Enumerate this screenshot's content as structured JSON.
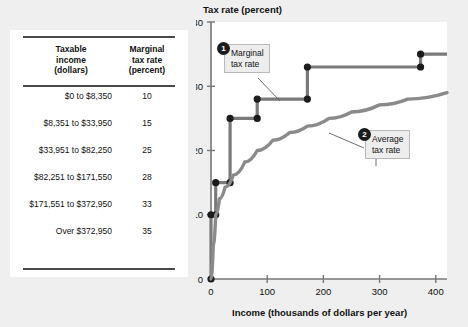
{
  "table": {
    "headers": {
      "income": "Taxable\nincome\n(dollars)",
      "income_l1": "Taxable",
      "income_l2": "income",
      "income_l3": "(dollars)",
      "rate_l1": "Marginal",
      "rate_l2": "tax rate",
      "rate_l3": "(percent)"
    },
    "rows": [
      {
        "income": "$0 to $8,350",
        "rate": "10"
      },
      {
        "income": "$8,351 to $33,950",
        "rate": "15"
      },
      {
        "income": "$33,951 to $82,250",
        "rate": "25"
      },
      {
        "income": "$82,251 to $171,550",
        "rate": "28"
      },
      {
        "income": "$171,551 to $372,950",
        "rate": "33"
      },
      {
        "income": "Over $372,950",
        "rate": "35"
      }
    ]
  },
  "callouts": [
    {
      "number": "1",
      "l1": "Marginal",
      "l2": "tax rate"
    },
    {
      "number": "2",
      "l1": "Average",
      "l2": "tax rate"
    }
  ],
  "chart_data": {
    "type": "line",
    "title": "",
    "ylabel": "Tax rate (percent)",
    "xlabel": "Income (thousands of dollars per year)",
    "xlim": [
      0,
      420
    ],
    "ylim": [
      0,
      40
    ],
    "xticks": [
      0,
      100,
      200,
      300,
      400
    ],
    "xtick_labels": [
      "0",
      "100",
      "200",
      "300",
      "400"
    ],
    "yticks": [
      0,
      10,
      20,
      30,
      40
    ],
    "ytick_labels": [
      "0",
      "10",
      "20",
      "30",
      "40"
    ],
    "grid": false,
    "legend": "none",
    "series": [
      {
        "name": "Marginal tax rate",
        "type": "step",
        "color": "#7a7a7a",
        "marker": "circle",
        "marker_color": "#1c1c1c",
        "points": [
          {
            "x": 0,
            "y": 0
          },
          {
            "x": 0,
            "y": 10
          },
          {
            "x": 8.35,
            "y": 10
          },
          {
            "x": 8.35,
            "y": 15
          },
          {
            "x": 33.95,
            "y": 15
          },
          {
            "x": 33.95,
            "y": 25
          },
          {
            "x": 82.25,
            "y": 25
          },
          {
            "x": 82.25,
            "y": 28
          },
          {
            "x": 171.55,
            "y": 28
          },
          {
            "x": 171.55,
            "y": 33
          },
          {
            "x": 372.95,
            "y": 33
          },
          {
            "x": 372.95,
            "y": 35
          },
          {
            "x": 420,
            "y": 35
          }
        ]
      },
      {
        "name": "Average tax rate",
        "type": "curve",
        "color": "#8a8a8a",
        "points": [
          {
            "x": 0,
            "y": 0
          },
          {
            "x": 4,
            "y": 5.2
          },
          {
            "x": 8.35,
            "y": 10
          },
          {
            "x": 15,
            "y": 12.5
          },
          {
            "x": 25,
            "y": 14.3
          },
          {
            "x": 40,
            "y": 16.2
          },
          {
            "x": 60,
            "y": 18.2
          },
          {
            "x": 82.25,
            "y": 20.0
          },
          {
            "x": 110,
            "y": 21.6
          },
          {
            "x": 140,
            "y": 22.8
          },
          {
            "x": 171.55,
            "y": 23.8
          },
          {
            "x": 210,
            "y": 25.0
          },
          {
            "x": 250,
            "y": 26.0
          },
          {
            "x": 300,
            "y": 27.1
          },
          {
            "x": 350,
            "y": 28.0
          },
          {
            "x": 420,
            "y": 29.0
          }
        ]
      }
    ]
  }
}
